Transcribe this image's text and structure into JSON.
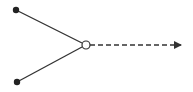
{
  "diagram": {
    "type": "merge-node",
    "colors": {
      "stroke": "#333333",
      "node_fill": "#222222",
      "hub_fill": "#ffffff",
      "background": "#ffffff"
    },
    "inputs": [
      {
        "id": "input-top",
        "x": 16,
        "y": 10
      },
      {
        "id": "input-bottom",
        "x": 17,
        "y": 82
      }
    ],
    "hub": {
      "x": 86,
      "y": 45,
      "r": 4
    },
    "output": {
      "x_end": 182,
      "y": 45,
      "style": "dashed",
      "arrow": true
    }
  }
}
